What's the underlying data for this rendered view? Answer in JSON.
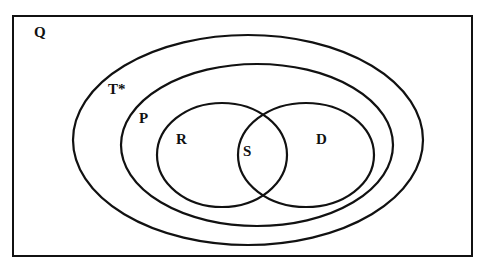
{
  "diagram": {
    "type": "venn",
    "universe": {
      "label": "Q",
      "x": 13,
      "y": 16,
      "w": 459,
      "h": 240,
      "label_x": 34,
      "label_y": 37
    },
    "sets": [
      {
        "id": "T",
        "label": "T*",
        "cx": 248,
        "cy": 140,
        "rx": 175,
        "ry": 105,
        "label_x": 108,
        "label_y": 94
      },
      {
        "id": "P",
        "label": "P",
        "cx": 257,
        "cy": 145,
        "rx": 136,
        "ry": 81,
        "label_x": 139,
        "label_y": 123
      },
      {
        "id": "R",
        "label": "R",
        "cx": 222,
        "cy": 155,
        "rx": 65,
        "ry": 52,
        "label_x": 176,
        "label_y": 144
      },
      {
        "id": "D",
        "label": "D",
        "cx": 306,
        "cy": 155,
        "rx": 68,
        "ry": 52,
        "label_x": 316,
        "label_y": 144
      }
    ],
    "intersection_label": {
      "label": "S",
      "x": 243,
      "y": 156
    },
    "relationships": [
      "R and D are subsets of P",
      "P is a subset of T*",
      "T* is a subset of Q",
      "S is the intersection of R and D"
    ],
    "stroke_color": "#111111",
    "background": "#ffffff"
  }
}
